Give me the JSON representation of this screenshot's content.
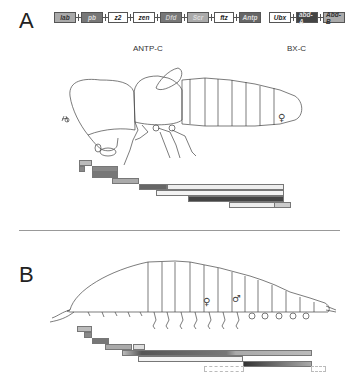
{
  "panel_a": {
    "letter": "A",
    "antp_c": {
      "label": "ANTP-C",
      "genes": [
        {
          "name": "lab",
          "fill": "#aaaaaa",
          "text": "#333333",
          "width": 22
        },
        {
          "name": "pb",
          "fill": "#777777",
          "text": "#dddddd",
          "width": 22
        },
        {
          "name": "z2",
          "fill": "#ffffff",
          "text": "#222222",
          "width": 20
        },
        {
          "name": "zen",
          "fill": "#ffffff",
          "text": "#222222",
          "width": 22
        },
        {
          "name": "Dfd",
          "fill": "#777777",
          "text": "#cccccc",
          "width": 22
        },
        {
          "name": "Scr",
          "fill": "#aaaaaa",
          "text": "#dddddd",
          "width": 22
        },
        {
          "name": "ftz",
          "fill": "#ffffff",
          "text": "#222222",
          "width": 20
        },
        {
          "name": "Antp",
          "fill": "#666666",
          "text": "#dddddd",
          "width": 22
        }
      ]
    },
    "bx_c": {
      "label": "BX-C",
      "genes": [
        {
          "name": "Ubx",
          "fill": "#ffffff",
          "text": "#222222",
          "width": 22
        },
        {
          "name": "abd-A",
          "fill": "#444444",
          "text": "#dddddd",
          "width": 22
        },
        {
          "name": "Abd-B",
          "fill": "#aaaaaa",
          "text": "#333333",
          "width": 22
        }
      ]
    },
    "organism": "insect (female)",
    "sex_symbol": "♀"
  },
  "panel_b": {
    "letter": "B",
    "organism": "myriapod",
    "sex_symbols": [
      "♀",
      "♂"
    ]
  }
}
